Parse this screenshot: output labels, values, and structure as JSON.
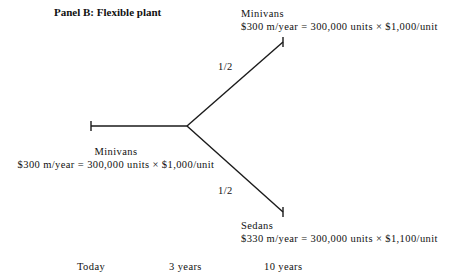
{
  "panel": {
    "title": "Panel B: Flexible plant"
  },
  "nodes": {
    "start": {
      "name": "Minivans",
      "value": "$300 m/year = 300,000 units × $1,000/unit"
    },
    "upper": {
      "name": "Minivans",
      "value": "$300 m/year = 300,000 units × $1,000/unit"
    },
    "lower": {
      "name": "Sedans",
      "value": "$330 m/year = 300,000 units × $1,100/unit"
    }
  },
  "branches": {
    "upper_probability": "1/2",
    "lower_probability": "1/2"
  },
  "timeline": [
    "Today",
    "3 years",
    "10 years"
  ],
  "colors": {
    "line": "#1a1a1a",
    "text": "#111111"
  }
}
